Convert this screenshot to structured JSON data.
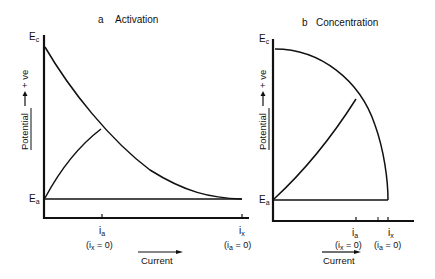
{
  "panels": {
    "a": {
      "letter": "a",
      "title": "Activation",
      "ec_label": "E",
      "ec_sub": "c",
      "ea_label": "E",
      "ea_sub": "a",
      "ylabel": "Potential",
      "ylabel_dir": "+ ve",
      "tick1_label": "i",
      "tick1_sub": "a",
      "tick1_note": "(i",
      "tick1_note_sub": "x",
      "tick1_note_end": " = 0)",
      "tick2_label": "i",
      "tick2_sub": "x",
      "tick2_note": "(i",
      "tick2_note_sub": "a",
      "tick2_note_end": " = 0)",
      "xlabel": "Current"
    },
    "b": {
      "letter": "b",
      "title": "Concentration",
      "ec_label": "E",
      "ec_sub": "c",
      "ea_label": "E",
      "ea_sub": "a",
      "ylabel": "Potential",
      "ylabel_dir": "+ ve",
      "tick1_label": "i",
      "tick1_sub": "a",
      "tick1_note": "(i",
      "tick1_note_sub": "x",
      "tick1_note_end": " = 0)",
      "tick2_label": "i",
      "tick2_sub": "x",
      "tick2_note": "(i",
      "tick2_note_sub": "a",
      "tick2_note_end": " = 0)",
      "xlabel": "Current"
    }
  }
}
